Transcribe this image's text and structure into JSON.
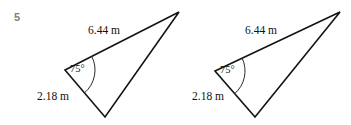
{
  "figure": {
    "problem_number": "5",
    "background_color": "#ffffff",
    "stroke_color": "#141414",
    "number_color": "#808080",
    "text_color": "#111111"
  },
  "triangles": [
    {
      "name": "triangle-left",
      "vertices": {
        "angle_vertex": {
          "x": 65,
          "y": 70
        },
        "apex": {
          "x": 179,
          "y": 12
        },
        "base": {
          "x": 105,
          "y": 117
        }
      },
      "labels": {
        "long_side": "6.44 m",
        "short_side": "2.18 m",
        "angle": "75°"
      },
      "label_positions": {
        "long_side": {
          "x": 88,
          "y": 25
        },
        "short_side": {
          "x": 37,
          "y": 91
        },
        "angle": {
          "x": 70,
          "y": 64
        }
      }
    },
    {
      "name": "triangle-right",
      "vertices": {
        "angle_vertex": {
          "x": 215,
          "y": 71
        },
        "apex": {
          "x": 340,
          "y": 12
        },
        "base": {
          "x": 255,
          "y": 117
        }
      },
      "labels": {
        "long_side": "6.44 m",
        "short_side": "2.18 m",
        "angle": "75°"
      },
      "label_positions": {
        "long_side": {
          "x": 245,
          "y": 25
        },
        "short_side": {
          "x": 192,
          "y": 91
        },
        "angle": {
          "x": 220,
          "y": 65
        }
      }
    }
  ]
}
